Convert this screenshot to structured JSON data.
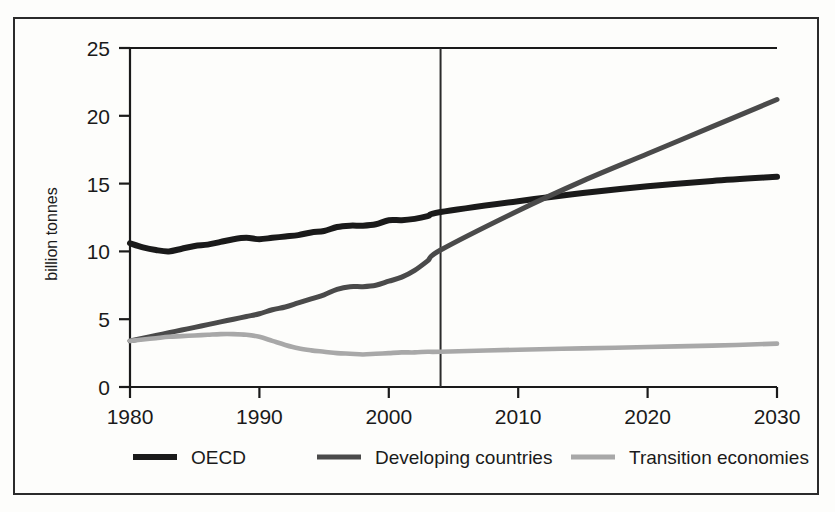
{
  "chart_data": {
    "type": "line",
    "title": "",
    "subtitle": "",
    "xlabel": "",
    "ylabel": "billion tonnes",
    "xlim": [
      1980,
      2030
    ],
    "ylim": [
      0,
      25
    ],
    "grid": false,
    "legend_position": "bottom",
    "xticks": [
      "1980",
      "1990",
      "2000",
      "2010",
      "2020",
      "2030"
    ],
    "xtick_values": [
      1980,
      1990,
      2000,
      2010,
      2020,
      2030
    ],
    "yticks": [
      "0",
      "5",
      "10",
      "15",
      "20",
      "25"
    ],
    "ytick_values": [
      0,
      5,
      10,
      15,
      20,
      25
    ],
    "annotations": [
      {
        "name": "projection-divider",
        "type": "vline",
        "x": 2004,
        "label": ""
      }
    ],
    "x": [
      1980,
      1981,
      1982,
      1983,
      1984,
      1985,
      1986,
      1987,
      1988,
      1989,
      1990,
      1991,
      1992,
      1993,
      1994,
      1995,
      1996,
      1997,
      1998,
      1999,
      2000,
      2001,
      2002,
      2003,
      2004,
      2010,
      2015,
      2020,
      2025,
      2030
    ],
    "series": [
      {
        "name": "OECD",
        "color": "#1a1a1a",
        "values": [
          10.6,
          10.3,
          10.1,
          10.0,
          10.2,
          10.4,
          10.5,
          10.7,
          10.9,
          11.0,
          10.9,
          11.0,
          11.1,
          11.2,
          11.4,
          11.5,
          11.8,
          11.9,
          11.9,
          12.0,
          12.3,
          12.3,
          12.4,
          12.6,
          12.9,
          13.7,
          14.3,
          14.8,
          15.2,
          15.5
        ]
      },
      {
        "name": "Developing countries",
        "color": "#4a4a4a",
        "values": [
          3.4,
          3.6,
          3.8,
          4.0,
          4.2,
          4.4,
          4.6,
          4.8,
          5.0,
          5.2,
          5.4,
          5.7,
          5.9,
          6.2,
          6.5,
          6.8,
          7.2,
          7.4,
          7.4,
          7.5,
          7.8,
          8.1,
          8.6,
          9.3,
          10.1,
          13.0,
          15.2,
          17.2,
          19.2,
          21.2
        ]
      },
      {
        "name": "Transition economies",
        "color": "#a8a8a8",
        "values": [
          3.4,
          3.5,
          3.6,
          3.7,
          3.75,
          3.8,
          3.85,
          3.9,
          3.9,
          3.85,
          3.7,
          3.4,
          3.1,
          2.85,
          2.7,
          2.6,
          2.5,
          2.45,
          2.4,
          2.45,
          2.5,
          2.55,
          2.55,
          2.6,
          2.6,
          2.75,
          2.85,
          2.95,
          3.05,
          3.2
        ]
      }
    ],
    "legend": [
      {
        "label": "OECD",
        "color": "#1a1a1a",
        "thickness": 6
      },
      {
        "label": "Developing countries",
        "color": "#4a4a4a",
        "thickness": 5
      },
      {
        "label": "Transition economies",
        "color": "#a8a8a8",
        "thickness": 5
      }
    ]
  }
}
